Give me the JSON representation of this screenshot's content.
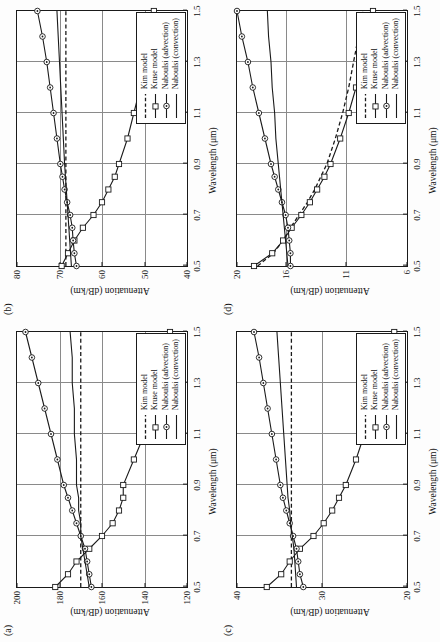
{
  "figure": {
    "orientation": "rotated-90-ccw",
    "shared_xlabel": "Wavelength (μm)",
    "shared_ylabel": "Attenuation (dB/km)",
    "xticks": [
      "0.5",
      "0.7",
      "0.9",
      "1.1",
      "1.3",
      "1.5"
    ],
    "series_names": [
      "Kim model",
      "Kruse model",
      "Naboulsi (advection)",
      "Naboulsi (convection)"
    ],
    "colors": {
      "ink": "#1a1a1a",
      "grid": "#8a8a8a",
      "paper": "#ffffff"
    }
  },
  "legend": {
    "items": [
      {
        "label": "Kim model",
        "style": "dashed",
        "marker": "none"
      },
      {
        "label": "Kruse model",
        "style": "solid",
        "marker": "square"
      },
      {
        "label": "Naboulsi (advection)",
        "style": "solid",
        "marker": "circle"
      },
      {
        "label": "Naboulsi (convection)",
        "style": "solid",
        "marker": "none"
      }
    ]
  },
  "chart_data": [
    {
      "type": "line",
      "panel": "(a)",
      "title": "(a)",
      "xlabel": "Wavelength (μm)",
      "ylabel": "Attenuation (dB/km)",
      "xlim": [
        0.5,
        1.5
      ],
      "ylim": [
        120,
        200
      ],
      "xticks": [
        0.5,
        0.7,
        0.9,
        1.1,
        1.3,
        1.5
      ],
      "yticks": [
        120,
        140,
        160,
        180,
        200
      ],
      "grid": true,
      "legend_position": "bottom-right",
      "x": [
        0.5,
        0.55,
        0.6,
        0.65,
        0.7,
        0.75,
        0.8,
        0.85,
        0.9,
        1.0,
        1.1,
        1.2,
        1.3,
        1.4,
        1.5
      ],
      "series": [
        {
          "name": "Kim model",
          "style": "dashed",
          "marker": "none",
          "values": [
            170,
            170,
            170,
            170,
            170,
            170,
            170,
            170,
            170,
            170,
            170,
            170,
            170,
            170,
            170
          ]
        },
        {
          "name": "Kruse model",
          "style": "solid",
          "marker": "square",
          "values": [
            182,
            176,
            172,
            166,
            160,
            155,
            152,
            150,
            150,
            145,
            140,
            136,
            133,
            130,
            128
          ]
        },
        {
          "name": "Naboulsi (advection)",
          "style": "solid",
          "marker": "circle",
          "values": [
            165,
            166,
            167,
            168,
            170,
            172,
            174,
            176,
            178,
            181,
            184,
            187,
            190,
            193,
            196
          ]
        },
        {
          "name": "Naboulsi (convection)",
          "style": "solid",
          "marker": "none",
          "values": [
            166,
            167,
            168,
            169,
            170,
            170,
            171,
            171,
            172,
            172,
            173,
            173,
            174,
            174,
            175
          ]
        }
      ]
    },
    {
      "type": "line",
      "panel": "(b)",
      "title": "(b)",
      "xlabel": "Wavelength (μm)",
      "ylabel": "Attenuation (dB/km)",
      "xlim": [
        0.5,
        1.5
      ],
      "ylim": [
        40,
        80
      ],
      "xticks": [
        0.5,
        0.7,
        0.9,
        1.1,
        1.3,
        1.5
      ],
      "yticks": [
        40,
        50,
        60,
        70,
        80
      ],
      "grid": true,
      "legend_position": "bottom-right",
      "x": [
        0.5,
        0.55,
        0.6,
        0.65,
        0.7,
        0.75,
        0.8,
        0.85,
        0.9,
        1.0,
        1.1,
        1.2,
        1.3,
        1.4,
        1.5
      ],
      "series": [
        {
          "name": "Kim model",
          "style": "dashed",
          "marker": "none",
          "values": [
            68.5,
            68.5,
            68.5,
            68.5,
            68.5,
            68.5,
            68.5,
            68.5,
            68.5,
            68.5,
            68.5,
            68.5,
            68.5,
            68.5,
            68.5
          ]
        },
        {
          "name": "Kruse model",
          "style": "solid",
          "marker": "square",
          "values": [
            69.5,
            68.0,
            66.5,
            64.5,
            62.0,
            60.0,
            58.5,
            57.0,
            56.0,
            54.0,
            52.5,
            51.0,
            50.0,
            48.8,
            47.8
          ]
        },
        {
          "name": "Naboulsi (advection)",
          "style": "solid",
          "marker": "circle",
          "values": [
            66.0,
            66.5,
            66.8,
            67.0,
            67.5,
            68.2,
            68.8,
            69.3,
            69.8,
            70.6,
            71.4,
            72.2,
            73.0,
            74.0,
            75.2
          ]
        },
        {
          "name": "Naboulsi (convection)",
          "style": "solid",
          "marker": "none",
          "values": [
            67.2,
            67.4,
            67.6,
            67.8,
            68.0,
            68.2,
            68.4,
            68.6,
            68.8,
            69.1,
            69.4,
            69.7,
            70.0,
            70.3,
            70.6
          ]
        }
      ]
    },
    {
      "type": "line",
      "panel": "(c)",
      "title": "(c)",
      "xlabel": "Wavelength (μm)",
      "ylabel": "Attenuation (dB/km)",
      "xlim": [
        0.5,
        1.5
      ],
      "ylim": [
        20,
        40
      ],
      "xticks": [
        0.5,
        0.7,
        0.9,
        1.1,
        1.3,
        1.5
      ],
      "yticks": [
        20,
        30,
        40
      ],
      "grid": true,
      "legend_position": "bottom-right",
      "x": [
        0.5,
        0.55,
        0.6,
        0.65,
        0.7,
        0.75,
        0.8,
        0.85,
        0.9,
        1.0,
        1.1,
        1.2,
        1.3,
        1.4,
        1.5
      ],
      "series": [
        {
          "name": "Kim model",
          "style": "dashed",
          "marker": "none",
          "values": [
            33.6,
            33.6,
            33.6,
            33.6,
            33.6,
            33.6,
            33.6,
            33.6,
            33.6,
            33.6,
            33.6,
            33.6,
            33.6,
            33.6,
            33.6
          ]
        },
        {
          "name": "Kruse model",
          "style": "solid",
          "marker": "square",
          "values": [
            36.5,
            34.8,
            33.8,
            32.6,
            31.0,
            29.8,
            28.8,
            28.0,
            27.2,
            26.0,
            25.0,
            24.2,
            23.4,
            22.4,
            21.5
          ]
        },
        {
          "name": "Naboulsi (advection)",
          "style": "solid",
          "marker": "circle",
          "values": [
            32.2,
            32.6,
            32.8,
            33.0,
            33.4,
            33.8,
            34.2,
            34.6,
            34.9,
            35.4,
            35.9,
            36.4,
            36.9,
            37.4,
            38.0
          ]
        },
        {
          "name": "Naboulsi (convection)",
          "style": "solid",
          "marker": "none",
          "values": [
            33.0,
            33.1,
            33.2,
            33.3,
            33.5,
            33.7,
            33.8,
            34.0,
            34.1,
            34.3,
            34.5,
            34.7,
            34.9,
            35.1,
            35.3
          ]
        }
      ]
    },
    {
      "type": "line",
      "panel": "(d)",
      "title": "(d)",
      "xlabel": "Wavelength (μm)",
      "ylabel": "Attenuation (dB/km)",
      "xlim": [
        0.5,
        1.5
      ],
      "ylim": [
        6,
        20
      ],
      "xticks": [
        0.5,
        0.7,
        0.9,
        1.1,
        1.3,
        1.5
      ],
      "yticks": [
        6,
        11,
        16,
        20
      ],
      "grid": true,
      "legend_position": "bottom-right",
      "x": [
        0.5,
        0.55,
        0.6,
        0.65,
        0.7,
        0.75,
        0.8,
        0.85,
        0.9,
        1.0,
        1.1,
        1.2,
        1.3,
        1.4,
        1.5
      ],
      "series": [
        {
          "name": "Kim model",
          "style": "dashed",
          "marker": "none",
          "values": [
            18.3,
            17.0,
            16.2,
            15.6,
            14.9,
            14.2,
            13.6,
            13.1,
            12.6,
            11.9,
            11.3,
            10.8,
            10.4,
            10.0,
            9.6
          ]
        },
        {
          "name": "Kruse model",
          "style": "solid",
          "marker": "square",
          "values": [
            18.6,
            17.1,
            16.2,
            15.5,
            14.7,
            14.0,
            13.4,
            12.8,
            12.3,
            11.5,
            10.8,
            10.2,
            9.7,
            9.2,
            8.8
          ]
        },
        {
          "name": "Naboulsi (advection)",
          "style": "solid",
          "marker": "circle",
          "values": [
            15.6,
            15.6,
            15.7,
            15.8,
            16.0,
            16.3,
            16.6,
            16.9,
            17.2,
            17.7,
            18.2,
            18.7,
            19.1,
            19.6,
            20.0
          ]
        },
        {
          "name": "Naboulsi (convection)",
          "style": "solid",
          "marker": "none",
          "values": [
            15.8,
            15.9,
            16.0,
            16.1,
            16.2,
            16.3,
            16.4,
            16.5,
            16.6,
            16.8,
            16.9,
            17.1,
            17.2,
            17.4,
            17.5
          ]
        }
      ]
    }
  ]
}
